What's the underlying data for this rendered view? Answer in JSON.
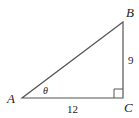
{
  "diagram": {
    "type": "right-triangle",
    "vertices": {
      "A": {
        "label": "A"
      },
      "B": {
        "label": "B"
      },
      "C": {
        "label": "C"
      }
    },
    "angle_label": "θ",
    "right_angle_at": "C",
    "sides": {
      "AC": "12",
      "BC": "9"
    },
    "stroke_color": "#555555"
  }
}
